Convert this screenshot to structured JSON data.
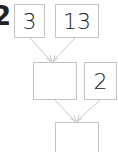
{
  "problem_number": "2",
  "boxes": {
    "top_left": "3",
    "top_right": "13",
    "middle_left": "",
    "middle_right": "2",
    "bottom": ""
  },
  "colors": {
    "line": "#c4c4c4",
    "text": "#222222"
  }
}
